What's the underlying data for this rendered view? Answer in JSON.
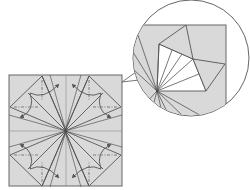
{
  "diagram": {
    "type": "origami-crease-pattern",
    "colors": {
      "background": "#ffffff",
      "paper": "#d9d9d9",
      "white_region": "#ffffff",
      "line": "#555555",
      "crease_line": "#8a8a8a",
      "arrow": "#555555"
    },
    "main_square": {
      "x": 9,
      "y": 75,
      "size": 113,
      "center": [
        66,
        131
      ]
    },
    "quadrant_template": {
      "description": "top-left quadrant; others mirrored",
      "outer_vertex_top": [
        42,
        76
      ],
      "outer_vertex_left": [
        10,
        107
      ],
      "inner_point": [
        28,
        93
      ],
      "valley_fold_vertical": [
        [
          42,
          80
        ],
        [
          42,
          100
        ]
      ],
      "valley_fold_horizontal": [
        [
          14,
          107
        ],
        [
          38,
          107
        ]
      ],
      "arrow_up": {
        "from": [
          30,
          93
        ],
        "ctrl": [
          44,
          100
        ],
        "to": [
          60,
          84
        ]
      },
      "arrow_down": {
        "from": [
          30,
          93
        ],
        "ctrl": [
          36,
          110
        ],
        "to": [
          20,
          118
        ]
      }
    },
    "callout": {
      "circle": {
        "cx": 191,
        "cy": 58,
        "r": 58
      },
      "pointer": [
        [
          136,
          74
        ],
        [
          122,
          82
        ],
        [
          138,
          80
        ]
      ],
      "inset_square": {
        "x": 130,
        "y": 25,
        "right": 226,
        "bottom": 115
      },
      "pivot": [
        157,
        91
      ],
      "white_kite": [
        [
          159,
          44
        ],
        [
          193,
          59
        ],
        [
          206,
          91
        ],
        [
          157,
          91
        ]
      ],
      "top_flap": [
        [
          159,
          44
        ],
        [
          186,
          25
        ],
        [
          193,
          59
        ]
      ],
      "right_flap": [
        [
          193,
          59
        ],
        [
          225,
          64
        ],
        [
          206,
          91
        ]
      ]
    }
  }
}
